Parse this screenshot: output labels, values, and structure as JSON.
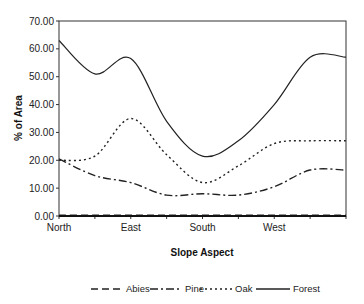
{
  "chart_data": {
    "type": "line",
    "title": "",
    "xlabel": "Slope Aspect",
    "ylabel": "% of Area",
    "ylim": [
      0,
      70
    ],
    "y_ticks": [
      "0.00",
      "10.00",
      "20.00",
      "30.00",
      "40.00",
      "50.00",
      "60.00",
      "70.00"
    ],
    "x": [
      "North",
      "NE",
      "East",
      "SE",
      "South",
      "SW",
      "West",
      "NW"
    ],
    "x_tick_labels": [
      {
        "label": "North",
        "index": 0
      },
      {
        "label": "East",
        "index": 2
      },
      {
        "label": "South",
        "index": 4
      },
      {
        "label": "West",
        "index": 6
      }
    ],
    "grid": false,
    "legend_position": "bottom",
    "series": [
      {
        "name": "Abies",
        "style": "dashed",
        "values": [
          0.3,
          0.3,
          0.3,
          0.3,
          0.3,
          0.3,
          0.3,
          0.3
        ]
      },
      {
        "name": "Pine",
        "style": "dash-dot",
        "values": [
          20.5,
          14.5,
          12.0,
          7.5,
          8.0,
          7.5,
          10.5,
          16.5
        ]
      },
      {
        "name": "Oak",
        "style": "dotted",
        "values": [
          20.0,
          21.5,
          35.0,
          22.0,
          12.0,
          18.0,
          26.0,
          27.0
        ]
      },
      {
        "name": "Forest",
        "style": "solid",
        "values": [
          63.0,
          51.0,
          56.5,
          34.0,
          21.5,
          27.0,
          40.0,
          57.0
        ]
      }
    ]
  }
}
